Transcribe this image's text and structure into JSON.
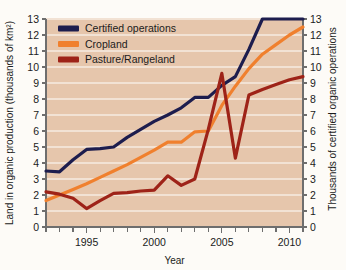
{
  "figure": {
    "ghost_text_top": "",
    "ghost_text_bottom": "",
    "background_color": "#fdfbf7",
    "plot_background_color": "#e6c6ac"
  },
  "chart_data": {
    "type": "line",
    "title": "",
    "xlabel": "Year",
    "ylabel": "Land in organic production (thousands of km²)",
    "y2label": "Thousands of certified organic operations",
    "xlim": [
      1992,
      2011
    ],
    "ylim": [
      0,
      13
    ],
    "y2lim": [
      0,
      13
    ],
    "grid": true,
    "grid_axis": "y",
    "legend_position": "top-left",
    "x_tick_labels": [
      "1995",
      "2000",
      "2005",
      "2010"
    ],
    "x_tick_values": [
      1995,
      2000,
      2005,
      2010
    ],
    "x_minor_ticks_every": 1,
    "y_tick_labels": [
      "0",
      "1",
      "2",
      "3",
      "4",
      "5",
      "6",
      "7",
      "8",
      "9",
      "10",
      "11",
      "12",
      "13"
    ],
    "y_tick_values": [
      0,
      1,
      2,
      3,
      4,
      5,
      6,
      7,
      8,
      9,
      10,
      11,
      12,
      13
    ],
    "y2_tick_labels": [
      "0",
      "1",
      "2",
      "3",
      "4",
      "5",
      "6",
      "7",
      "8",
      "9",
      "10",
      "11",
      "12",
      "13"
    ],
    "y2_tick_values": [
      0,
      1,
      2,
      3,
      4,
      5,
      6,
      7,
      8,
      9,
      10,
      11,
      12,
      13
    ],
    "x": [
      1992,
      1993,
      1994,
      1995,
      1996,
      1997,
      1998,
      1999,
      2000,
      2001,
      2002,
      2003,
      2004,
      2005,
      2006,
      2007,
      2008,
      2009,
      2010,
      2011
    ],
    "series": [
      {
        "name": "Certified operations",
        "color": "#1d1d4e",
        "axis": "right",
        "values": [
          3.5,
          3.45,
          4.2,
          4.85,
          4.9,
          5.0,
          5.6,
          6.1,
          6.6,
          7.0,
          7.45,
          8.1,
          8.1,
          8.85,
          9.4,
          11.1,
          13.0,
          13.0,
          13.0,
          13.0
        ]
      },
      {
        "name": "Cropland",
        "color": "#f0802e",
        "axis": "left",
        "values": [
          1.65,
          2.0,
          2.35,
          2.7,
          3.1,
          3.5,
          3.9,
          4.35,
          4.8,
          5.3,
          5.3,
          5.95,
          6.0,
          7.6,
          8.8,
          9.9,
          10.8,
          11.4,
          12.0,
          12.5
        ]
      },
      {
        "name": "Pasture/Rangeland",
        "color": "#9e2318",
        "axis": "left",
        "values": [
          2.2,
          2.05,
          1.8,
          1.15,
          1.65,
          2.1,
          2.15,
          2.25,
          2.3,
          3.2,
          2.6,
          3.0,
          6.1,
          9.6,
          4.3,
          8.25,
          8.6,
          8.9,
          9.2,
          9.4
        ]
      }
    ]
  }
}
